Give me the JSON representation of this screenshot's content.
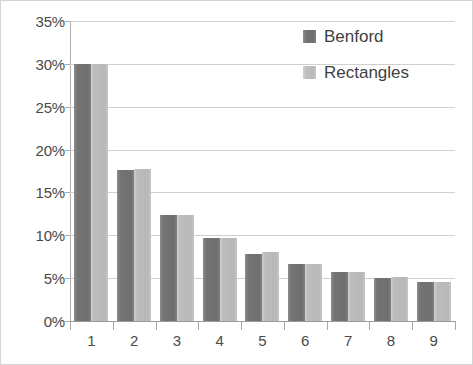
{
  "chart_data": {
    "type": "bar",
    "title": "",
    "subtitle": "",
    "xlabel": "",
    "ylabel": "",
    "categories": [
      "1",
      "2",
      "3",
      "4",
      "5",
      "6",
      "7",
      "8",
      "9"
    ],
    "series": [
      {
        "name": "Benford",
        "color": "#747474",
        "values": [
          30.0,
          17.6,
          12.4,
          9.7,
          7.8,
          6.6,
          5.7,
          5.0,
          4.5
        ]
      },
      {
        "name": "Rectangles",
        "color": "#bcbcbc",
        "values": [
          30.0,
          17.7,
          12.4,
          9.7,
          8.0,
          6.6,
          5.7,
          5.1,
          4.6
        ]
      }
    ],
    "ylim": [
      0,
      35
    ],
    "y_ticks": [
      0,
      5,
      10,
      15,
      20,
      25,
      30,
      35
    ],
    "y_tick_labels": [
      "0%",
      "5%",
      "10%",
      "15%",
      "20%",
      "25%",
      "30%",
      "35%"
    ],
    "value_suffix": "%",
    "grid": true,
    "grid_axis": "y",
    "legend_position": "top-right",
    "legend": [
      {
        "label": "Benford",
        "swatch": "benford"
      },
      {
        "label": "Rectangles",
        "swatch": "rectangles"
      }
    ],
    "plot_background": "#ffffff",
    "gridline_color": "#d0d0d0",
    "axis_color": "#9a9a9a",
    "border_color": "#d4d4d4"
  }
}
